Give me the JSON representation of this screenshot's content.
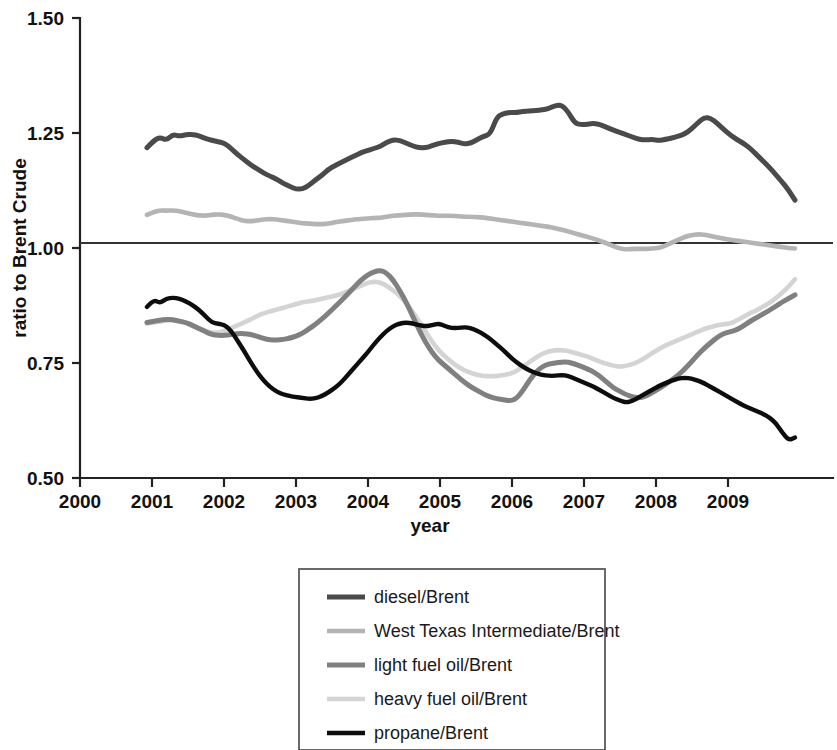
{
  "chart_data": {
    "type": "line",
    "title": "",
    "xlabel": "year",
    "ylabel": "ratio to Brent Crude",
    "xlim": [
      2000,
      2010
    ],
    "ylim": [
      0.5,
      1.5
    ],
    "xticks": [
      "2000",
      "2001",
      "2002",
      "2003",
      "2004",
      "2005",
      "2006",
      "2007",
      "2008",
      "2009"
    ],
    "xtick_values": [
      2000,
      2001,
      2002,
      2003,
      2004,
      2005,
      2006,
      2007,
      2008,
      2009
    ],
    "yticks": [
      "0.50",
      "0.75",
      "1.00",
      "1.25",
      "1.50"
    ],
    "ytick_values": [
      0.5,
      0.75,
      1.0,
      1.25,
      1.5
    ],
    "grid": false,
    "reference_line": 1.0,
    "legend_position": "below-center",
    "x": [
      2000.93,
      2001.02,
      2001.11,
      2001.2,
      2001.29,
      2001.38,
      2001.47,
      2001.56,
      2001.65,
      2001.74,
      2001.83,
      2001.92,
      2002.01,
      2002.1,
      2002.19,
      2002.28,
      2002.37,
      2002.46,
      2002.55,
      2002.64,
      2002.73,
      2002.82,
      2002.91,
      2003.0,
      2003.09,
      2003.18,
      2003.27,
      2003.36,
      2003.45,
      2003.54,
      2003.63,
      2003.72,
      2003.81,
      2003.9,
      2003.99,
      2004.08,
      2004.17,
      2004.26,
      2004.35,
      2004.44,
      2004.53,
      2004.62,
      2004.71,
      2004.8,
      2004.89,
      2004.98,
      2005.07,
      2005.16,
      2005.25,
      2005.34,
      2005.43,
      2005.52,
      2005.61,
      2005.7,
      2005.79,
      2005.88,
      2005.97,
      2006.06,
      2006.15,
      2006.24,
      2006.33,
      2006.42,
      2006.51,
      2006.6,
      2006.69,
      2006.78,
      2006.87,
      2006.96,
      2007.05,
      2007.14,
      2007.23,
      2007.32,
      2007.41,
      2007.5,
      2007.59,
      2007.68,
      2007.77,
      2007.86,
      2007.95,
      2008.04,
      2008.13,
      2008.22,
      2008.31,
      2008.4,
      2008.49,
      2008.58,
      2008.67,
      2008.76,
      2008.85,
      2008.94,
      2009.03,
      2009.12,
      2009.21,
      2009.3,
      2009.39,
      2009.48,
      2009.57,
      2009.66,
      2009.75,
      2009.84,
      2009.93
    ],
    "series": [
      {
        "name": "diesel/Brent",
        "color": "#4a4a4a",
        "width": 5.0,
        "values": [
          1.218,
          1.233,
          1.241,
          1.234,
          1.247,
          1.243,
          1.246,
          1.247,
          1.244,
          1.238,
          1.234,
          1.231,
          1.228,
          1.216,
          1.203,
          1.192,
          1.181,
          1.172,
          1.163,
          1.156,
          1.15,
          1.141,
          1.134,
          1.128,
          1.128,
          1.136,
          1.148,
          1.158,
          1.171,
          1.179,
          1.186,
          1.193,
          1.2,
          1.207,
          1.212,
          1.216,
          1.221,
          1.23,
          1.235,
          1.234,
          1.228,
          1.222,
          1.218,
          1.218,
          1.222,
          1.227,
          1.23,
          1.232,
          1.23,
          1.226,
          1.228,
          1.236,
          1.243,
          1.248,
          1.285,
          1.292,
          1.295,
          1.294,
          1.297,
          1.298,
          1.299,
          1.3,
          1.303,
          1.31,
          1.311,
          1.296,
          1.272,
          1.268,
          1.269,
          1.271,
          1.268,
          1.262,
          1.256,
          1.251,
          1.246,
          1.241,
          1.236,
          1.235,
          1.236,
          1.234,
          1.236,
          1.239,
          1.243,
          1.248,
          1.258,
          1.272,
          1.284,
          1.282,
          1.271,
          1.258,
          1.246,
          1.236,
          1.228,
          1.218,
          1.204,
          1.19,
          1.176,
          1.16,
          1.144,
          1.126,
          1.104
        ]
      },
      {
        "name": "West Texas Intermediate/Brent",
        "color": "#b4b4b4",
        "width": 4.6,
        "values": [
          1.072,
          1.078,
          1.082,
          1.081,
          1.082,
          1.08,
          1.077,
          1.073,
          1.071,
          1.07,
          1.072,
          1.073,
          1.072,
          1.068,
          1.063,
          1.059,
          1.058,
          1.06,
          1.062,
          1.063,
          1.062,
          1.06,
          1.058,
          1.056,
          1.054,
          1.053,
          1.052,
          1.052,
          1.053,
          1.056,
          1.058,
          1.06,
          1.062,
          1.063,
          1.064,
          1.065,
          1.066,
          1.068,
          1.07,
          1.071,
          1.072,
          1.073,
          1.073,
          1.072,
          1.071,
          1.07,
          1.07,
          1.07,
          1.069,
          1.068,
          1.068,
          1.067,
          1.066,
          1.064,
          1.062,
          1.06,
          1.058,
          1.056,
          1.054,
          1.052,
          1.05,
          1.048,
          1.046,
          1.043,
          1.04,
          1.036,
          1.032,
          1.028,
          1.024,
          1.02,
          1.015,
          1.01,
          1.004,
          0.999,
          0.997,
          0.998,
          0.998,
          0.998,
          0.999,
          1.0,
          1.005,
          1.012,
          1.018,
          1.024,
          1.028,
          1.03,
          1.029,
          1.026,
          1.023,
          1.02,
          1.018,
          1.016,
          1.014,
          1.012,
          1.01,
          1.008,
          1.006,
          1.004,
          1.002,
          1.0,
          0.999
        ]
      },
      {
        "name": "light fuel oil/Brent",
        "color": "#808080",
        "width": 5.0,
        "values": [
          0.838,
          0.841,
          0.843,
          0.845,
          0.844,
          0.841,
          0.838,
          0.832,
          0.825,
          0.818,
          0.812,
          0.81,
          0.81,
          0.812,
          0.814,
          0.814,
          0.812,
          0.808,
          0.803,
          0.8,
          0.8,
          0.801,
          0.804,
          0.808,
          0.815,
          0.824,
          0.834,
          0.846,
          0.858,
          0.872,
          0.886,
          0.9,
          0.915,
          0.93,
          0.941,
          0.948,
          0.952,
          0.946,
          0.93,
          0.908,
          0.882,
          0.852,
          0.822,
          0.795,
          0.773,
          0.756,
          0.744,
          0.732,
          0.72,
          0.708,
          0.698,
          0.69,
          0.682,
          0.676,
          0.672,
          0.67,
          0.668,
          0.672,
          0.69,
          0.712,
          0.73,
          0.742,
          0.748,
          0.75,
          0.752,
          0.752,
          0.748,
          0.743,
          0.737,
          0.73,
          0.72,
          0.708,
          0.696,
          0.688,
          0.681,
          0.676,
          0.674,
          0.678,
          0.686,
          0.694,
          0.703,
          0.713,
          0.724,
          0.737,
          0.752,
          0.768,
          0.782,
          0.794,
          0.806,
          0.814,
          0.818,
          0.822,
          0.83,
          0.84,
          0.848,
          0.856,
          0.864,
          0.873,
          0.882,
          0.89,
          0.898
        ]
      },
      {
        "name": "heavy fuel oil/Brent",
        "color": "#d4d4d4",
        "width": 4.6,
        "values": [
          0.836,
          0.838,
          0.84,
          0.843,
          0.843,
          0.842,
          0.838,
          0.832,
          0.826,
          0.82,
          0.816,
          0.816,
          0.82,
          0.826,
          0.832,
          0.838,
          0.845,
          0.852,
          0.858,
          0.862,
          0.866,
          0.87,
          0.874,
          0.878,
          0.882,
          0.884,
          0.886,
          0.89,
          0.893,
          0.896,
          0.9,
          0.906,
          0.912,
          0.918,
          0.924,
          0.927,
          0.925,
          0.918,
          0.908,
          0.896,
          0.88,
          0.862,
          0.84,
          0.818,
          0.796,
          0.778,
          0.764,
          0.752,
          0.742,
          0.734,
          0.728,
          0.724,
          0.722,
          0.721,
          0.722,
          0.724,
          0.726,
          0.732,
          0.742,
          0.752,
          0.762,
          0.77,
          0.775,
          0.778,
          0.778,
          0.776,
          0.772,
          0.768,
          0.764,
          0.758,
          0.752,
          0.748,
          0.744,
          0.742,
          0.744,
          0.748,
          0.754,
          0.762,
          0.772,
          0.78,
          0.788,
          0.794,
          0.8,
          0.806,
          0.812,
          0.818,
          0.824,
          0.828,
          0.832,
          0.834,
          0.836,
          0.842,
          0.85,
          0.858,
          0.864,
          0.872,
          0.88,
          0.89,
          0.902,
          0.916,
          0.932
        ]
      },
      {
        "name": "propane/Brent",
        "color": "#0d0d0d",
        "width": 4.4,
        "values": [
          0.872,
          0.888,
          0.88,
          0.89,
          0.892,
          0.89,
          0.884,
          0.876,
          0.866,
          0.852,
          0.838,
          0.835,
          0.833,
          0.82,
          0.798,
          0.776,
          0.752,
          0.73,
          0.712,
          0.698,
          0.688,
          0.682,
          0.678,
          0.676,
          0.674,
          0.672,
          0.673,
          0.678,
          0.686,
          0.696,
          0.708,
          0.724,
          0.74,
          0.756,
          0.772,
          0.79,
          0.806,
          0.82,
          0.83,
          0.836,
          0.838,
          0.836,
          0.832,
          0.83,
          0.832,
          0.836,
          0.83,
          0.826,
          0.826,
          0.828,
          0.826,
          0.82,
          0.812,
          0.802,
          0.79,
          0.778,
          0.764,
          0.752,
          0.742,
          0.734,
          0.728,
          0.724,
          0.722,
          0.722,
          0.724,
          0.722,
          0.716,
          0.71,
          0.704,
          0.698,
          0.69,
          0.682,
          0.674,
          0.668,
          0.664,
          0.668,
          0.676,
          0.684,
          0.692,
          0.7,
          0.706,
          0.712,
          0.716,
          0.718,
          0.716,
          0.712,
          0.706,
          0.698,
          0.69,
          0.682,
          0.674,
          0.666,
          0.658,
          0.652,
          0.646,
          0.64,
          0.632,
          0.62,
          0.6,
          0.582,
          0.588
        ]
      }
    ],
    "legend": [
      "diesel/Brent",
      "West Texas Intermediate/Brent",
      "light fuel oil/Brent",
      "heavy fuel oil/Brent",
      "propane/Brent"
    ]
  }
}
